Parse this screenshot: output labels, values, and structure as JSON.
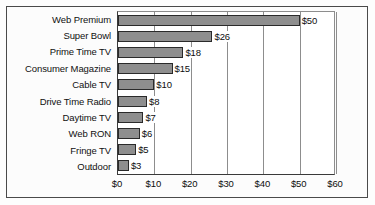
{
  "chart_data": {
    "type": "bar",
    "orientation": "horizontal",
    "title": "",
    "xlabel": "",
    "ylabel": "",
    "categories": [
      "Web Premium",
      "Super Bowl",
      "Prime Time TV",
      "Consumer Magazine",
      "Cable TV",
      "Drive Time Radio",
      "Daytime TV",
      "Web RON",
      "Fringe TV",
      "Outdoor"
    ],
    "values": [
      50,
      26,
      18,
      15,
      10,
      8,
      7,
      6,
      5,
      3
    ],
    "value_labels": [
      "$50",
      "$26",
      "$18",
      "$15",
      "$10",
      "$8",
      "$7",
      "$6",
      "$5",
      "$3"
    ],
    "xlim": [
      0,
      60
    ],
    "xticks": [
      0,
      10,
      20,
      30,
      40,
      50,
      60
    ],
    "xtick_labels": [
      "$0",
      "$10",
      "$20",
      "$30",
      "$40",
      "$50",
      "$60"
    ],
    "grid": true,
    "grid_axis": "x",
    "legend": false,
    "colors": {
      "bar_fill": "#8e8e8e",
      "bar_border": "#2a2a2a",
      "gridline": "#8d8d8d",
      "axis": "#3a3a3a",
      "frame": "#4a4a4a",
      "text": "#0d0d0d",
      "plot_background": "#ffffff",
      "figure_background": "#fcfcfc"
    }
  }
}
